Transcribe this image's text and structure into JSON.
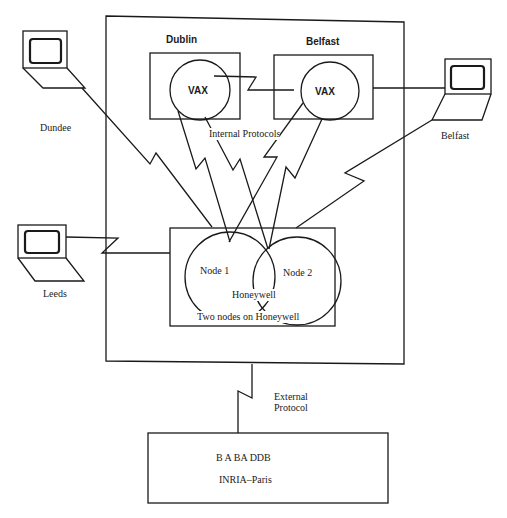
{
  "diagram": {
    "header_fragment": "... VAX",
    "sites": {
      "dublin": {
        "label": "Dublin",
        "node": "VAX"
      },
      "belfast": {
        "label": "Belfast",
        "node": "VAX"
      }
    },
    "internal_protocols_label": "Internal Protocols",
    "terminals": {
      "dundee": "Dundee",
      "belfast": "Belfast",
      "leeds": "Leeds"
    },
    "honeywell": {
      "node1": "Node 1",
      "node2": "Node 2",
      "center_label": "Honeywell",
      "caption": "Two nodes on Honeywell"
    },
    "external_protocol": {
      "line1": "External",
      "line2": "Protocol"
    },
    "remote": {
      "line1": "B A BA  DDB",
      "line2": "INRIA–Paris"
    },
    "colors": {
      "ink": "#1a1a1a",
      "background": "#ffffff"
    }
  }
}
